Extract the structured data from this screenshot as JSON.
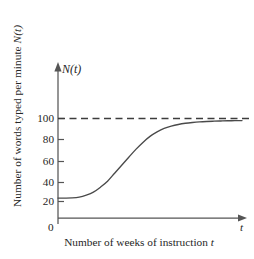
{
  "figure": {
    "background_color": "#ffffff",
    "ink_color": "#4a4a4a",
    "text_color": "#262626"
  },
  "axes": {
    "y_axis_symbol_prefix": "N",
    "y_axis_symbol_arg": "(t)",
    "x_axis_symbol": "t",
    "origin_label": "0",
    "y_title_plain": "Number of words typed per minute ",
    "y_title_symbol": "N",
    "y_title_symbol_arg": "(t)",
    "x_title_plain": "Number of weeks of instruction ",
    "x_title_symbol": "t"
  },
  "ticks": {
    "y": [
      {
        "label": "20",
        "value": 20
      },
      {
        "label": "40",
        "value": 40
      },
      {
        "label": "60",
        "value": 60
      },
      {
        "label": "80",
        "value": 80
      },
      {
        "label": "100",
        "value": 100
      }
    ]
  },
  "chart_data": {
    "type": "line",
    "title": "",
    "subtitle": "",
    "xlabel": "Number of weeks of instruction t",
    "ylabel": "Number of words typed per minute N(t)",
    "xlim": [
      0,
      26
    ],
    "ylim": [
      0,
      122
    ],
    "grid": false,
    "legend": null,
    "yticks": [
      20,
      40,
      60,
      80,
      100
    ],
    "ytick_labels": [
      "20",
      "40",
      "60",
      "80",
      "100"
    ],
    "xticks": [],
    "xtick_labels": [],
    "annotations": [
      {
        "name": "asymptote",
        "type": "horizontal-dashed-line",
        "value": 100,
        "label": ""
      }
    ],
    "series": [
      {
        "name": "N(t)",
        "style": "solid",
        "color": "#4a4a4a",
        "x": [
          0,
          1,
          2,
          3,
          4,
          5,
          6,
          7,
          8,
          9,
          10,
          11,
          12,
          13,
          14,
          15,
          16,
          17,
          18,
          19,
          20,
          21,
          22,
          23,
          24,
          25,
          26
        ],
        "y": [
          20,
          20,
          20.2,
          21,
          23,
          26,
          31,
          37,
          45,
          53,
          61,
          69,
          76,
          82,
          86.5,
          90,
          92.3,
          94,
          95.2,
          96,
          96.6,
          97,
          97.3,
          97.5,
          97.7,
          97.8,
          97.9
        ]
      }
    ]
  }
}
